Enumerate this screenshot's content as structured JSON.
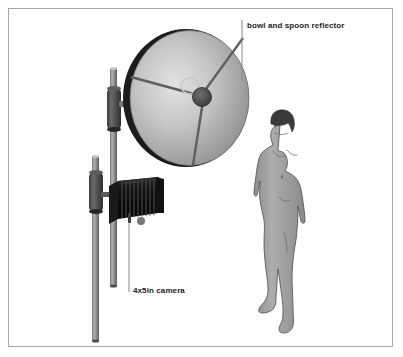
{
  "figure": {
    "type": "technical-illustration",
    "background_color": "#ffffff",
    "border_color": "#a8a8a8",
    "labels": [
      {
        "id": "reflector",
        "text": "bowl and spoon reflector",
        "x": 247,
        "y": 21,
        "leader_line": {
          "x": 242,
          "y1": 20,
          "y2": 80
        }
      },
      {
        "id": "camera",
        "text": "4x5in camera",
        "x": 133,
        "y": 286,
        "leader_line": {
          "x": 129,
          "y1": 222,
          "y2": 292
        }
      }
    ],
    "components": {
      "reflector_dish": {
        "name": "bowl and spoon reflector",
        "center_x": 187,
        "center_y": 98,
        "radius_x": 62,
        "radius_y": 68,
        "face_color_light": "#d8d8d8",
        "face_color_dark": "#8e8e8e",
        "rim_color": "#1f1f1f",
        "spoke_count": 3,
        "hub_color": "#4a4a4a",
        "spoon_ring_color": "#cfcfcf"
      },
      "camera": {
        "name": "4x5in camera",
        "x": 110,
        "y": 182,
        "width": 52,
        "height": 38,
        "body_color": "#121212",
        "bellows_pleats": 11,
        "highlight_color": "#4d4d4d"
      },
      "stand_dish": {
        "name": "reflector stand",
        "x": 113,
        "top": 68,
        "bottom": 286,
        "pole_color": "#8d8d8d",
        "clamp_color": "#4f4f4f"
      },
      "stand_camera": {
        "name": "camera stand",
        "x": 95,
        "top": 156,
        "bottom": 341,
        "pole_color": "#8d8d8d",
        "clamp_color": "#4f4f4f"
      },
      "figure_model": {
        "name": "human scale figure",
        "x": 255,
        "top": 108,
        "bottom": 330,
        "body_color": "#9a9a9a",
        "outline_color": "#5a5a5a",
        "hair_color": "#3a3a3a"
      }
    }
  }
}
